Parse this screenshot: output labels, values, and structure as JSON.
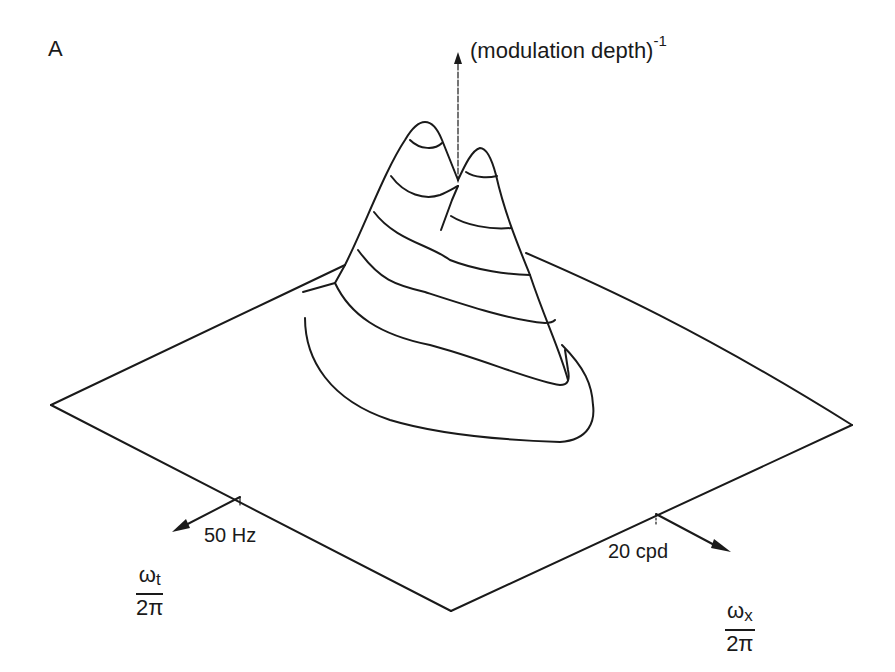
{
  "figure": {
    "panel_label": "A",
    "z_axis": {
      "label": "(modulation depth)",
      "exponent": "-1"
    },
    "t_axis": {
      "tick_label": "50 Hz",
      "symbol": "ω",
      "subscript": "t",
      "denominator": "2π"
    },
    "x_axis": {
      "tick_label": "20 cpd",
      "symbol": "ω",
      "subscript": "x",
      "denominator": "2π"
    },
    "surface": {
      "description": "3D contour-lined surface with two peaks over a frequency plane",
      "peaks": 2,
      "contour_count": 6
    },
    "colors": {
      "ink": "#1a1a1a",
      "background": "#ffffff"
    }
  }
}
